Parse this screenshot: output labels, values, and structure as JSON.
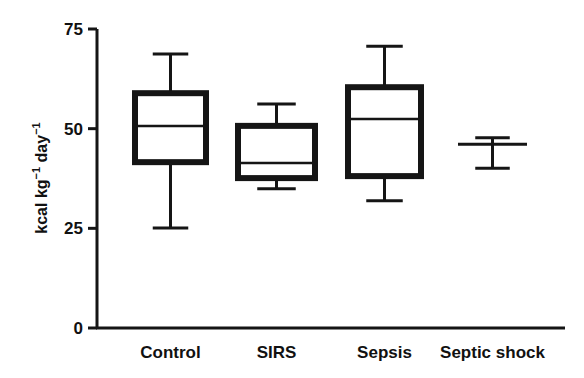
{
  "chart_data": {
    "type": "box",
    "title": "",
    "xlabel": "",
    "ylabel": "kcal kg⁻¹ day⁻¹",
    "ylabel_parts": [
      "kcal kg",
      "−1",
      " day",
      "−1"
    ],
    "ylim": [
      0,
      75
    ],
    "yticks": [
      0,
      25,
      50,
      75
    ],
    "grid": false,
    "legend": null,
    "categories": [
      "Control",
      "SIRS",
      "Sepsis",
      "Septic shock"
    ],
    "series": [
      {
        "name": "Control",
        "whisker_low": 25.1,
        "q1": 41.6,
        "median": 50.7,
        "q3": 58.9,
        "whisker_high": 68.7
      },
      {
        "name": "SIRS",
        "whisker_low": 34.9,
        "q1": 37.6,
        "median": 41.4,
        "q3": 50.7,
        "whisker_high": 56.2
      },
      {
        "name": "Sepsis",
        "whisker_low": 31.9,
        "q1": 38.1,
        "median": 52.4,
        "q3": 60.4,
        "whisker_high": 70.7
      },
      {
        "name": "Septic shock",
        "whisker_low": 40.1,
        "q1": 46.1,
        "median": 46.1,
        "q3": 46.1,
        "whisker_high": 47.7
      }
    ]
  },
  "layout": {
    "plot_left": 97,
    "plot_bottom": 328,
    "plot_top": 29,
    "plot_right": 565,
    "box_x": [
      [
        135,
        206
      ],
      [
        238,
        315
      ],
      [
        348,
        421
      ],
      [
        458,
        527
      ]
    ],
    "color": "#151515"
  }
}
